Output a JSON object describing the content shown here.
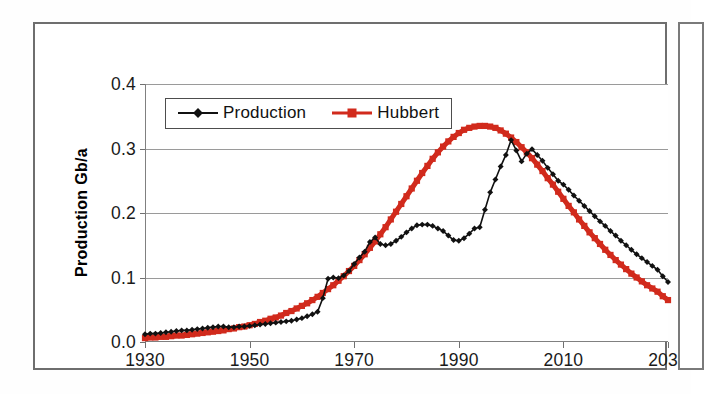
{
  "figure": {
    "has_outer_frame": true,
    "adjacent_figure_sliver": true
  },
  "chart_data": {
    "type": "line",
    "title": "",
    "xlabel": "",
    "ylabel": "Production Gb/a",
    "xlim": [
      1930,
      2030
    ],
    "ylim": [
      0.0,
      0.4
    ],
    "xticks": [
      1930,
      1950,
      1970,
      1990,
      2010,
      2030
    ],
    "xtick_labels": [
      "1930",
      "1950",
      "1970",
      "1990",
      "2010",
      "2030"
    ],
    "yticks": [
      0.0,
      0.1,
      0.2,
      0.3,
      0.4
    ],
    "ytick_labels": [
      "0.0",
      "0.1",
      "0.2",
      "0.3",
      "0.4"
    ],
    "grid": "horizontal",
    "legend_position": "top-left-inside",
    "colors": {
      "production": "#111111",
      "hubbert": "#D12A1C",
      "gridline": "#9a9a9a",
      "axis": "#808080",
      "frame": "#6e6e6e"
    },
    "markers": {
      "production": "diamond",
      "hubbert": "square"
    },
    "x": [
      1930,
      1931,
      1932,
      1933,
      1934,
      1935,
      1936,
      1937,
      1938,
      1939,
      1940,
      1941,
      1942,
      1943,
      1944,
      1945,
      1946,
      1947,
      1948,
      1949,
      1950,
      1951,
      1952,
      1953,
      1954,
      1955,
      1956,
      1957,
      1958,
      1959,
      1960,
      1961,
      1962,
      1963,
      1964,
      1965,
      1966,
      1967,
      1968,
      1969,
      1970,
      1971,
      1972,
      1973,
      1974,
      1975,
      1976,
      1977,
      1978,
      1979,
      1980,
      1981,
      1982,
      1983,
      1984,
      1985,
      1986,
      1987,
      1988,
      1989,
      1990,
      1991,
      1992,
      1993,
      1994,
      1995,
      1996,
      1997,
      1998,
      1999,
      2000,
      2001,
      2002,
      2003,
      2004,
      2005,
      2006,
      2007,
      2008,
      2009,
      2010,
      2011,
      2012,
      2013,
      2014,
      2015,
      2016,
      2017,
      2018,
      2019,
      2020,
      2021,
      2022,
      2023,
      2024,
      2025,
      2026,
      2027,
      2028,
      2029,
      2030
    ],
    "series": [
      {
        "name": "Production",
        "color": "#111111",
        "marker": "diamond",
        "values": [
          0.012,
          0.013,
          0.013,
          0.014,
          0.015,
          0.016,
          0.017,
          0.018,
          0.018,
          0.019,
          0.02,
          0.021,
          0.022,
          0.023,
          0.024,
          0.024,
          0.023,
          0.023,
          0.024,
          0.024,
          0.025,
          0.026,
          0.027,
          0.028,
          0.029,
          0.03,
          0.031,
          0.032,
          0.033,
          0.035,
          0.037,
          0.04,
          0.043,
          0.047,
          0.068,
          0.098,
          0.1,
          0.099,
          0.103,
          0.11,
          0.121,
          0.131,
          0.14,
          0.155,
          0.162,
          0.152,
          0.15,
          0.152,
          0.157,
          0.163,
          0.17,
          0.176,
          0.181,
          0.182,
          0.182,
          0.18,
          0.176,
          0.172,
          0.165,
          0.158,
          0.157,
          0.161,
          0.168,
          0.176,
          0.178,
          0.205,
          0.232,
          0.252,
          0.272,
          0.29,
          0.313,
          0.297,
          0.28,
          0.292,
          0.299,
          0.29,
          0.281,
          0.27,
          0.26,
          0.25,
          0.244,
          0.236,
          0.227,
          0.219,
          0.211,
          0.203,
          0.195,
          0.187,
          0.18,
          0.172,
          0.165,
          0.157,
          0.15,
          0.143,
          0.136,
          0.13,
          0.124,
          0.118,
          0.112,
          0.102,
          0.093
        ]
      },
      {
        "name": "Hubbert",
        "color": "#D12A1C",
        "marker": "square",
        "values": [
          0.006,
          0.007,
          0.007,
          0.008,
          0.008,
          0.009,
          0.01,
          0.01,
          0.011,
          0.012,
          0.013,
          0.014,
          0.015,
          0.016,
          0.017,
          0.018,
          0.02,
          0.021,
          0.023,
          0.024,
          0.026,
          0.028,
          0.031,
          0.033,
          0.036,
          0.038,
          0.041,
          0.045,
          0.048,
          0.052,
          0.056,
          0.06,
          0.065,
          0.07,
          0.076,
          0.082,
          0.088,
          0.095,
          0.102,
          0.11,
          0.118,
          0.127,
          0.136,
          0.146,
          0.156,
          0.167,
          0.178,
          0.19,
          0.202,
          0.214,
          0.226,
          0.238,
          0.25,
          0.262,
          0.273,
          0.284,
          0.294,
          0.303,
          0.311,
          0.318,
          0.324,
          0.329,
          0.332,
          0.334,
          0.335,
          0.335,
          0.334,
          0.332,
          0.328,
          0.323,
          0.317,
          0.31,
          0.302,
          0.294,
          0.285,
          0.275,
          0.265,
          0.254,
          0.244,
          0.233,
          0.222,
          0.211,
          0.201,
          0.19,
          0.18,
          0.17,
          0.161,
          0.152,
          0.143,
          0.135,
          0.127,
          0.12,
          0.113,
          0.106,
          0.1,
          0.094,
          0.088,
          0.083,
          0.078,
          0.071,
          0.065
        ]
      }
    ]
  },
  "legend": {
    "items": [
      {
        "label": "Production",
        "color": "#111111",
        "marker": "diamond"
      },
      {
        "label": "Hubbert",
        "color": "#D12A1C",
        "marker": "square"
      }
    ]
  },
  "axis_titles": {
    "y": "Production Gb/a"
  }
}
